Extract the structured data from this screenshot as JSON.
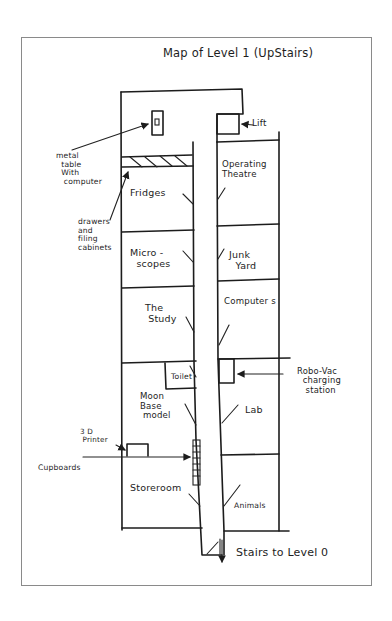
{
  "title": "Map of Level 1 (UpStairs)",
  "rooms": {
    "fridges": "Fridges",
    "microscopes": "Micro -\n  scopes",
    "study": "The\n Study",
    "toilet": "Toilet",
    "moon_base": "Moon\nBase\n model",
    "storeroom": "Storeroom",
    "operating_theatre": "Operating\nTheatre",
    "junk_yard": "Junk\n  Yard",
    "computers": "Computer s",
    "lab": "Lab",
    "animals": "Animals"
  },
  "annotations": {
    "metal_table": "metal\n  table\n  With\n   computer",
    "drawers": "drawers\nand\nfiling\ncabinets",
    "lift": "Lift",
    "robo_vac": "Robo-Vac\n  charging\n   station",
    "printer_3d": "3 D\n Printer",
    "cupboards": "Cupboards",
    "stairs": "Stairs to Level 0"
  },
  "colors": {
    "ink": "#1c1c1c",
    "frame": "#8a8a8a",
    "paper": "#ffffff"
  }
}
